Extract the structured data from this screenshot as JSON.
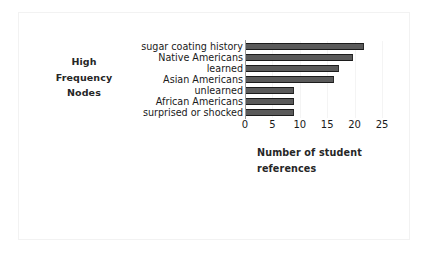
{
  "chart_data": {
    "type": "bar",
    "orientation": "horizontal",
    "title": "",
    "xlabel_lines": [
      "Number of  student",
      "references"
    ],
    "xlabel": "Number of  student references",
    "ylabel_lines": [
      "High",
      "Frequency",
      "Nodes"
    ],
    "ylabel": "High Frequency Nodes",
    "categories": [
      "sugar coating history",
      "Native Americans",
      "learned",
      "Asian Americans",
      "unlearned",
      "African Americans",
      "surprised or shocked"
    ],
    "values": [
      21.5,
      19.5,
      17,
      16,
      8.7,
      8.7,
      8.7
    ],
    "xlim": [
      0,
      25
    ],
    "xticks": [
      0,
      5,
      10,
      15,
      20,
      25
    ],
    "xtick_labels": [
      "0",
      "5",
      "10",
      "15",
      "20",
      "25"
    ],
    "grid": "vertical-light",
    "legend": "none",
    "bar_color": "#5a5a5a",
    "bar_edge_color": "#1c1c1c",
    "axis_color": "#9a9a9a",
    "background": "#ffffff"
  }
}
